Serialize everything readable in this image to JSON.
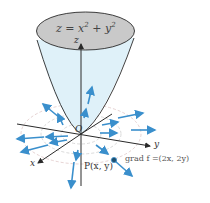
{
  "diagram": {
    "surface_equation": "z = x² + y²",
    "surface_equation_parts": {
      "lhs": "z = x",
      "exp1": "2",
      "mid": "+ y",
      "exp2": "2"
    },
    "axes": {
      "z": "z",
      "y": "y",
      "x": "x",
      "origin": "O"
    },
    "point_label": "P(x, y)",
    "gradient_label": "grad f =(2x, 2y)",
    "colors": {
      "surface_fill": "#dff1f9",
      "top_ellipse": "#c9c9c9",
      "arrow": "#3a8fcc",
      "axis": "#2a2a2a",
      "level_curves": "#c9c9c9",
      "point": "#1f4f6e"
    }
  }
}
